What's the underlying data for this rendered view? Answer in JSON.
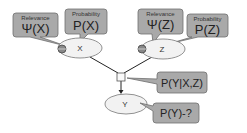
{
  "nodes": {
    "x": {
      "label": "X"
    },
    "z": {
      "label": "Z"
    },
    "y": {
      "label": "Y"
    }
  },
  "callouts": {
    "x_relevance": {
      "title": "Relevance",
      "formula": "Ψ(X)"
    },
    "x_probability": {
      "title": "Probability",
      "formula": "P(X)"
    },
    "z_relevance": {
      "title": "Relevance",
      "formula": "Ψ(Z)"
    },
    "z_probability": {
      "title": "Probability",
      "formula": "P(Z)"
    },
    "factor": {
      "formula": "P(Y|X,Z)"
    },
    "y_query": {
      "formula": "P(Y)-?"
    }
  },
  "colors": {
    "callout_fill": "#a9a9a9",
    "callout_stroke": "#6e6e6e",
    "ellipse_fill": "#f2f2f2",
    "edge": "#222222"
  }
}
